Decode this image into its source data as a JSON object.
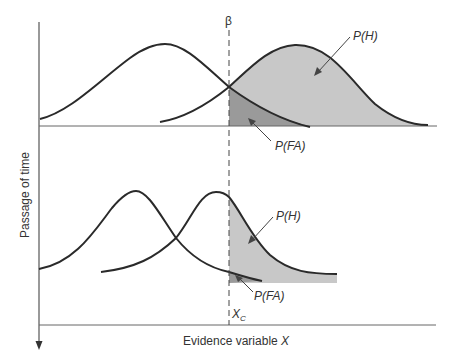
{
  "figure": {
    "y_axis_label": "Passage of time",
    "x_axis_label": "Evidence variable ",
    "x_axis_var": "X",
    "beta_label": "β",
    "criterion_label_main": "X",
    "criterion_label_sub": "C",
    "top_panel": {
      "hit_label": "P(H)",
      "false_alarm_label": "P(FA)"
    },
    "bottom_panel": {
      "hit_label": "P(H)",
      "false_alarm_label": "P(FA)"
    },
    "colors": {
      "line": "#2a2a2a",
      "hit_fill": "#c8c8c8",
      "fa_fill": "#9a9a9a",
      "axis": "#555555"
    }
  }
}
